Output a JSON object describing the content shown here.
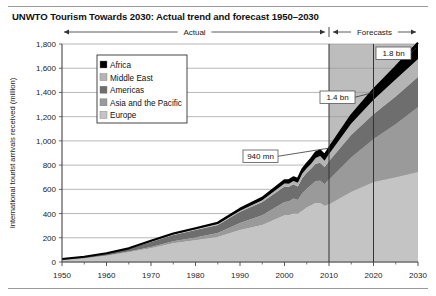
{
  "title": "UNWTO Tourism Towards 2030: Actual trend and forecast 1950–2030",
  "axes": {
    "ylabel": "International tourist arrivals received (million)",
    "yticks": [
      "0",
      "200",
      "400",
      "600",
      "800",
      "1,000",
      "1,200",
      "1,400",
      "1,600",
      "1,800"
    ],
    "xticks": [
      "1950",
      "1960",
      "1970",
      "1980",
      "1990",
      "2000",
      "2010",
      "2020",
      "2030"
    ]
  },
  "spans": {
    "actual": "Actual",
    "forecasts": "Forecasts"
  },
  "callouts": {
    "a": "940 mn",
    "b": "1.4 bn",
    "c": "1.8 bn"
  },
  "legend": {
    "items": [
      {
        "label": "Africa",
        "color": "#000000"
      },
      {
        "label": "Middle East",
        "color": "#b4b4b4"
      },
      {
        "label": "Americas",
        "color": "#6e6e6e"
      },
      {
        "label": "Asia and the Pacific",
        "color": "#9a9a9a"
      },
      {
        "label": "Europe",
        "color": "#c4c4c4"
      }
    ]
  },
  "colors": {
    "africa": "#000000",
    "middle_east": "#b4b4b4",
    "americas": "#6e6e6e",
    "asia_pacific": "#9a9a9a",
    "europe": "#c4c4c4",
    "forecast_band": "#bdbdbd",
    "grid": "#9a9a9a",
    "axis": "#444444"
  },
  "chart_data": {
    "type": "area",
    "title": "UNWTO Tourism Towards 2030: Actual trend and forecast 1950–2030",
    "xlabel": "",
    "ylabel": "International tourist arrivals received (million)",
    "ylim": [
      0,
      1800
    ],
    "xlim": [
      1950,
      2030
    ],
    "grid": true,
    "legend_position": "upper-left-inside",
    "stacked": true,
    "forecast_start": 2010,
    "annotations": [
      {
        "text": "940 mn",
        "year": 2010,
        "value": 940
      },
      {
        "text": "1.4 bn",
        "year": 2020,
        "value": 1400
      },
      {
        "text": "1.8 bn",
        "year": 2030,
        "value": 1800
      }
    ],
    "x": [
      1950,
      1955,
      1960,
      1965,
      1970,
      1975,
      1980,
      1985,
      1990,
      1995,
      2000,
      2001,
      2002,
      2003,
      2004,
      2005,
      2006,
      2007,
      2008,
      2009,
      2010,
      2015,
      2020,
      2025,
      2030
    ],
    "series": [
      {
        "name": "Europe",
        "values": [
          17,
          29,
          51,
          80,
          113,
          154,
          180,
          206,
          265,
          305,
          386,
          385,
          400,
          398,
          424,
          450,
          468,
          487,
          487,
          462,
          477,
          580,
          660,
          700,
          744
        ]
      },
      {
        "name": "Asia and the Pacific",
        "values": [
          0.2,
          1,
          3,
          6,
          10,
          18,
          23,
          34,
          56,
          82,
          110,
          115,
          125,
          113,
          144,
          154,
          167,
          182,
          184,
          181,
          204,
          285,
          355,
          440,
          535
        ]
      },
      {
        "name": "Americas",
        "values": [
          7,
          12,
          16,
          23,
          43,
          50,
          62,
          65,
          93,
          109,
          128,
          122,
          117,
          113,
          126,
          133,
          136,
          143,
          148,
          141,
          150,
          184,
          205,
          227,
          248
        ]
      },
      {
        "name": "Middle East",
        "values": [
          0.2,
          0.6,
          1,
          2,
          6,
          8,
          7,
          9,
          10,
          14,
          24,
          25,
          27,
          30,
          36,
          37,
          41,
          47,
          56,
          53,
          60,
          95,
          120,
          141,
          149
        ]
      },
      {
        "name": "Africa",
        "values": [
          0.5,
          1,
          1,
          2,
          3,
          5,
          7,
          10,
          15,
          20,
          26,
          29,
          30,
          31,
          34,
          37,
          41,
          45,
          45,
          46,
          49,
          66,
          85,
          105,
          134
        ]
      }
    ]
  }
}
